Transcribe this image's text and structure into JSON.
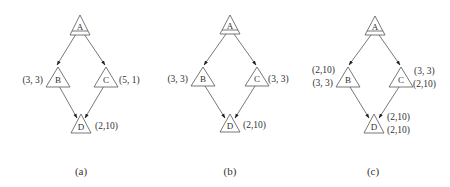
{
  "panels": [
    {
      "caption": "(a)",
      "nodes": {
        "A": "A",
        "B": "B",
        "C": "C",
        "D": "D"
      },
      "labels": {
        "B": [
          "(3, 3)"
        ],
        "C": [
          "(5, 1)"
        ],
        "D": [
          "(2,10)"
        ]
      }
    },
    {
      "caption": "(b)",
      "nodes": {
        "A": "A",
        "B": "B",
        "C": "C",
        "D": "D"
      },
      "labels": {
        "B": [
          "(3, 3)"
        ],
        "C": [
          "(3, 3)"
        ],
        "D": [
          "(2,10)"
        ]
      }
    },
    {
      "caption": "(c)",
      "nodes": {
        "A": "A",
        "B": "B",
        "C": "C",
        "D": "D"
      },
      "labels": {
        "B": [
          "(2,10)",
          "(3, 3)"
        ],
        "C": [
          "(3, 3)",
          "(2,10)"
        ],
        "D": [
          "(2,10)",
          "(2,10)"
        ]
      }
    }
  ],
  "colors": {
    "stroke": "#555555",
    "text": "#333333",
    "background": "#ffffff"
  }
}
